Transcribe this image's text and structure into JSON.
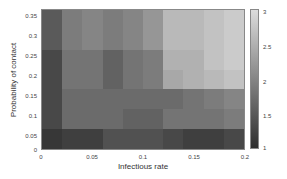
{
  "chart_data": {
    "type": "heatmap",
    "title": "",
    "xlabel": "Infectious rate",
    "ylabel": "Probability of contact",
    "xlim": [
      0,
      0.2
    ],
    "ylim": [
      0,
      0.35
    ],
    "x_ticks": [
      "0",
      "0.05",
      "0.1",
      "0.15",
      "0.2"
    ],
    "y_ticks": [
      "0.35",
      "0.3",
      "0.25",
      "0.2",
      "0.15",
      "0.1",
      "0.05",
      "0"
    ],
    "x_bins": [
      0.0,
      0.02,
      0.04,
      0.06,
      0.08,
      0.1,
      0.12,
      0.14,
      0.16,
      0.18
    ],
    "y_bins_top_to_bottom": [
      0.3,
      0.25,
      0.2,
      0.15,
      0.1,
      0.05,
      0.0
    ],
    "values": [
      [
        1.5,
        1.9,
        2.0,
        1.9,
        2.0,
        2.2,
        2.6,
        2.6,
        2.7,
        2.8
      ],
      [
        1.5,
        1.9,
        2.0,
        1.9,
        2.0,
        2.2,
        2.6,
        2.6,
        2.7,
        2.8
      ],
      [
        1.3,
        1.8,
        1.8,
        1.6,
        1.8,
        1.9,
        2.5,
        2.5,
        2.7,
        2.8
      ],
      [
        1.3,
        1.8,
        1.8,
        1.6,
        1.8,
        1.9,
        2.4,
        2.5,
        2.6,
        2.7
      ],
      [
        1.3,
        1.7,
        1.7,
        1.7,
        1.7,
        1.7,
        1.7,
        1.8,
        1.9,
        2.0
      ],
      [
        1.3,
        1.7,
        1.7,
        1.7,
        1.6,
        1.6,
        1.8,
        1.8,
        1.8,
        1.9
      ],
      [
        1.1,
        1.2,
        1.2,
        1.4,
        1.4,
        1.4,
        1.3,
        1.2,
        1.2,
        1.3
      ]
    ],
    "colorbar": {
      "range": [
        1,
        3
      ],
      "ticks": [
        "3",
        "2.5",
        "2",
        "1.5",
        "1"
      ],
      "colormap": "gray",
      "low_color": "#2e2e2e",
      "high_color": "#dcdcdc"
    },
    "grid": false,
    "legend": "colorbar-right"
  }
}
